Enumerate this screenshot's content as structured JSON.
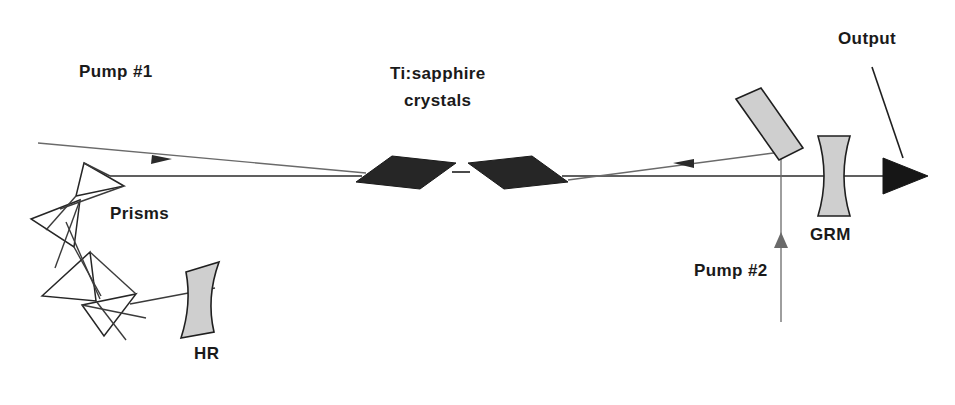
{
  "figure": {
    "background_color": "#ffffff"
  },
  "labels": {
    "pump1": "Pump #1",
    "pump2": "Pump #2",
    "crystals_line1": "Ti:sapphire",
    "crystals_line2": "crystals",
    "prisms": "Prisms",
    "hr": "HR",
    "grm": "GRM",
    "output": "Output"
  },
  "colors": {
    "beam": "#3b3b3b",
    "pump_beam": "#6a6a6a",
    "mirror_fill": "#cfcfcf",
    "mirror_stroke": "#1f1f1f",
    "crystal_fill": "#262626",
    "text": "#1a1a1a",
    "background": "#ffffff"
  },
  "components": [
    {
      "name": "prism-1",
      "type": "dispersive-prism",
      "count_in_group": 4
    },
    {
      "name": "prism-2",
      "type": "dispersive-prism"
    },
    {
      "name": "prism-3",
      "type": "dispersive-prism"
    },
    {
      "name": "prism-4",
      "type": "dispersive-prism"
    },
    {
      "name": "hr-mirror",
      "type": "curved-high-reflector",
      "label": "HR"
    },
    {
      "name": "crystal-left",
      "type": "brewster-cut-gain-medium"
    },
    {
      "name": "crystal-right",
      "type": "brewster-cut-gain-medium"
    },
    {
      "name": "dichroic-mirror",
      "type": "flat-tilted-mirror"
    },
    {
      "name": "grm-mirror",
      "type": "gradient-reflectivity-output-coupler",
      "label": "GRM"
    }
  ],
  "beams": [
    {
      "name": "pump-beam-1",
      "label": "Pump #1",
      "direction": "down-right"
    },
    {
      "name": "pump-beam-2",
      "label": "Pump #2",
      "direction": "up"
    },
    {
      "name": "cavity-beam",
      "label": "",
      "direction": "horizontal"
    },
    {
      "name": "output-beam",
      "label": "Output",
      "direction": "right"
    }
  ]
}
